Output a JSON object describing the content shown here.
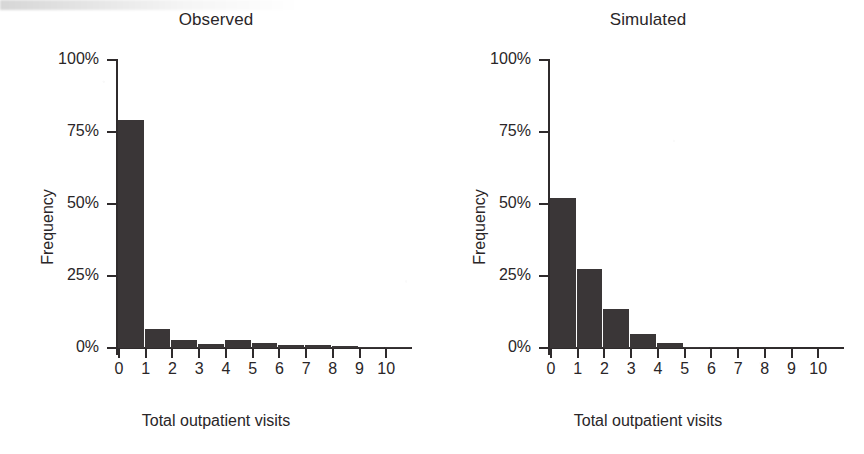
{
  "figure": {
    "axis_label_x": "Total outpatient visits",
    "axis_label_y": "Frequency",
    "bar_color": "#3a3637",
    "axis_color": "#2f2b2c",
    "text_color": "#2a2628",
    "background": "#ffffff"
  },
  "chart_data": [
    {
      "type": "bar",
      "title": "Observed",
      "xlabel": "Total outpatient visits",
      "ylabel": "Frequency",
      "categories": [
        "0",
        "1",
        "2",
        "3",
        "4",
        "5",
        "6",
        "7",
        "8",
        "9",
        "10"
      ],
      "values": [
        79,
        6.5,
        2.8,
        1.5,
        2.8,
        1.8,
        1.2,
        1.0,
        0.8,
        0.4,
        0.2
      ],
      "yticks": [
        0,
        25,
        50,
        75,
        100
      ],
      "ytick_labels": [
        "0%",
        "25%",
        "50%",
        "75%",
        "100%"
      ],
      "xtick_labels": [
        "0",
        "1",
        "2",
        "3",
        "4",
        "5",
        "6",
        "7",
        "8",
        "9",
        "10"
      ],
      "ylim": [
        0,
        100
      ],
      "xlim": [
        0,
        11
      ],
      "grid": false,
      "legend": "none"
    },
    {
      "type": "bar",
      "title": "Simulated",
      "xlabel": "Total outpatient visits",
      "ylabel": "Frequency",
      "categories": [
        "0",
        "1",
        "2",
        "3",
        "4",
        "5",
        "6",
        "7",
        "8",
        "9",
        "10"
      ],
      "values": [
        52,
        27.5,
        13.5,
        5.0,
        1.8,
        0.5,
        0.15,
        0.05,
        0.02,
        0.0,
        0.0
      ],
      "yticks": [
        0,
        25,
        50,
        75,
        100
      ],
      "ytick_labels": [
        "0%",
        "25%",
        "50%",
        "75%",
        "100%"
      ],
      "xtick_labels": [
        "0",
        "1",
        "2",
        "3",
        "4",
        "5",
        "6",
        "7",
        "8",
        "9",
        "10"
      ],
      "ylim": [
        0,
        100
      ],
      "xlim": [
        0,
        11
      ],
      "grid": false,
      "legend": "none"
    }
  ]
}
